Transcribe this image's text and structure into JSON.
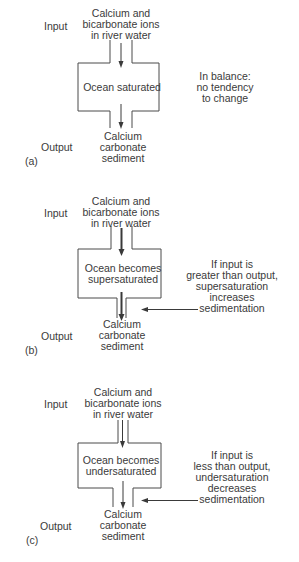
{
  "panels": [
    {
      "id": "a",
      "label": "(a)",
      "input_label": "Input",
      "output_label": "Output",
      "input_text": [
        "Calcium and",
        "bicarbonate ions",
        "in river water"
      ],
      "box_text": [
        "Ocean saturated"
      ],
      "output_text": [
        "Calcium",
        "carbonate",
        "sediment"
      ],
      "note_text": [
        "In balance:",
        "no tendency",
        "to change"
      ],
      "note_arrow": false,
      "top_channel": "wide",
      "bottom_channel": "wide",
      "top_arrow": "normal",
      "bottom_arrow": "normal"
    },
    {
      "id": "b",
      "label": "(b)",
      "input_label": "Input",
      "output_label": "Output",
      "input_text": [
        "Calcium and",
        "bicarbonate ions",
        "in river water"
      ],
      "box_text": [
        "Ocean becomes",
        "supersaturated"
      ],
      "output_text": [
        "Calcium",
        "carbonate",
        "sediment"
      ],
      "note_text": [
        "If input is",
        "greater than output,",
        "supersaturation",
        "increases",
        "sedimentation"
      ],
      "note_arrow": true,
      "top_channel": "wide",
      "bottom_channel": "narrow",
      "top_arrow": "thick",
      "bottom_arrow": "thick"
    },
    {
      "id": "c",
      "label": "(c)",
      "input_label": "Input",
      "output_label": "Output",
      "input_text": [
        "Calcium and",
        "bicarbonate ions",
        "in river water"
      ],
      "box_text": [
        "Ocean becomes",
        "undersaturated"
      ],
      "output_text": [
        "Calcium",
        "carbonate",
        "sediment"
      ],
      "note_text": [
        "If input is",
        "less than output,",
        "undersaturation",
        "decreases",
        "sedimentation"
      ],
      "note_arrow": true,
      "top_channel": "narrow",
      "bottom_channel": "wide",
      "top_arrow": "thin",
      "bottom_arrow": "thin"
    }
  ],
  "colors": {
    "line": "#4a4a4a",
    "text": "#3a3a3a",
    "background": "#ffffff"
  }
}
